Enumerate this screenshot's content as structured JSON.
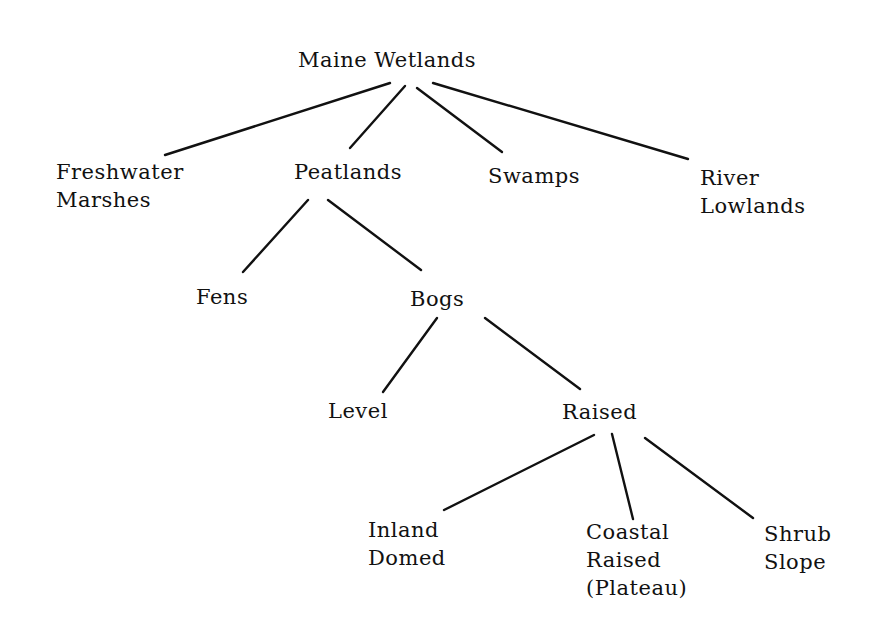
{
  "diagram": {
    "title": "Maine Wetlands",
    "type": "tree",
    "nodes": {
      "root": {
        "label": "Maine Wetlands",
        "lines": [
          "Maine Wetlands"
        ],
        "x": 298,
        "y": 46
      },
      "freshwater": {
        "label": "Freshwater Marshes",
        "lines": [
          "Freshwater",
          "Marshes"
        ],
        "x": 56,
        "y": 158
      },
      "peatlands": {
        "label": "Peatlands",
        "lines": [
          "Peatlands"
        ],
        "x": 294,
        "y": 158
      },
      "swamps": {
        "label": "Swamps",
        "lines": [
          "Swamps"
        ],
        "x": 488,
        "y": 162
      },
      "river": {
        "label": "River Lowlands",
        "lines": [
          "River",
          "Lowlands"
        ],
        "x": 700,
        "y": 164
      },
      "fens": {
        "label": "Fens",
        "lines": [
          "Fens"
        ],
        "x": 196,
        "y": 283
      },
      "bogs": {
        "label": "Bogs",
        "lines": [
          "Bogs"
        ],
        "x": 410,
        "y": 285
      },
      "level": {
        "label": "Level",
        "lines": [
          "Level"
        ],
        "x": 328,
        "y": 397
      },
      "raised": {
        "label": "Raised",
        "lines": [
          "Raised"
        ],
        "x": 562,
        "y": 398
      },
      "inland": {
        "label": "Inland Domed",
        "lines": [
          "Inland",
          "Domed"
        ],
        "x": 368,
        "y": 516
      },
      "coastal": {
        "label": "Coastal Raised (Plateau)",
        "lines": [
          "Coastal",
          "Raised",
          "(Plateau)"
        ],
        "x": 586,
        "y": 518
      },
      "shrub": {
        "label": "Shrub Slope",
        "lines": [
          "Shrub",
          "Slope"
        ],
        "x": 764,
        "y": 520
      }
    },
    "edges": [
      {
        "from": "root",
        "to": "freshwater",
        "x1": 390,
        "y1": 83,
        "x2": 165,
        "y2": 155
      },
      {
        "from": "root",
        "to": "peatlands",
        "x1": 405,
        "y1": 86,
        "x2": 350,
        "y2": 148
      },
      {
        "from": "root",
        "to": "swamps",
        "x1": 417,
        "y1": 88,
        "x2": 502,
        "y2": 152
      },
      {
        "from": "root",
        "to": "river",
        "x1": 433,
        "y1": 83,
        "x2": 688,
        "y2": 159
      },
      {
        "from": "peatlands",
        "to": "fens",
        "x1": 308,
        "y1": 200,
        "x2": 243,
        "y2": 272
      },
      {
        "from": "peatlands",
        "to": "bogs",
        "x1": 328,
        "y1": 200,
        "x2": 421,
        "y2": 270
      },
      {
        "from": "bogs",
        "to": "level",
        "x1": 437,
        "y1": 318,
        "x2": 383,
        "y2": 392
      },
      {
        "from": "bogs",
        "to": "raised",
        "x1": 485,
        "y1": 318,
        "x2": 580,
        "y2": 389
      },
      {
        "from": "raised",
        "to": "inland",
        "x1": 594,
        "y1": 435,
        "x2": 444,
        "y2": 510
      },
      {
        "from": "raised",
        "to": "coastal",
        "x1": 612,
        "y1": 434,
        "x2": 633,
        "y2": 519
      },
      {
        "from": "raised",
        "to": "shrub",
        "x1": 645,
        "y1": 438,
        "x2": 753,
        "y2": 518
      }
    ]
  }
}
